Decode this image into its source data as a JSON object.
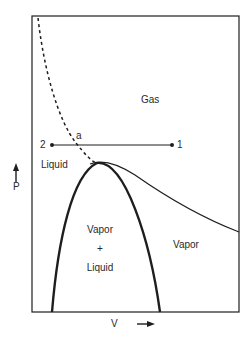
{
  "diagram": {
    "type": "pressure-volume phase diagram",
    "axes": {
      "y_label": "P",
      "x_label": "V"
    },
    "regions": {
      "gas": "Gas",
      "liquid": "Liquid",
      "vapor_liquid": [
        "Vapor",
        "+",
        "Liquid"
      ],
      "vapor": "Vapor"
    },
    "points": {
      "point_2": "2",
      "point_1": "1",
      "point_a": "a"
    },
    "colors": {
      "line": "#1e1e1e",
      "background": "#ffffff"
    }
  }
}
